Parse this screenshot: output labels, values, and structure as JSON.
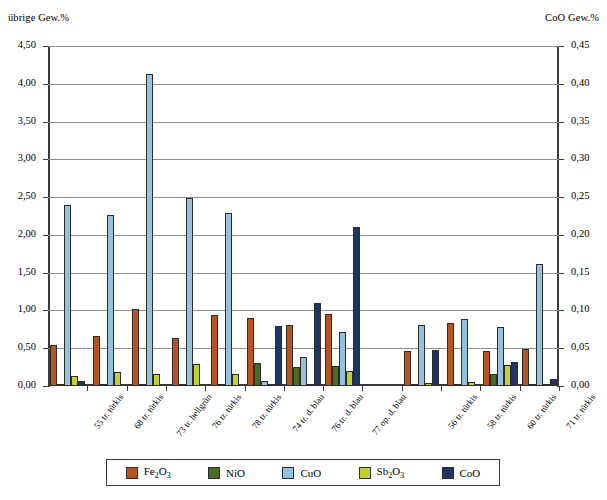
{
  "chart_data": {
    "type": "bar",
    "title": "",
    "subtitle": "",
    "xlabel": "",
    "ylabel": "übrige Gew.%",
    "ylabel_right": "CoO Gew.%",
    "ylim": [
      0,
      4.5
    ],
    "ylim_right": [
      0,
      0.45
    ],
    "ytick_step": 0.5,
    "ytick_step_right": 0.05,
    "grid": true,
    "legend_position": "bottom",
    "yticks_left": [
      "0,00",
      "0,50",
      "1,00",
      "1,50",
      "2,00",
      "2,50",
      "3,00",
      "3,50",
      "4,00",
      "4,50"
    ],
    "yticks_right": [
      "0,00",
      "0,05",
      "0,10",
      "0,15",
      "0,20",
      "0,25",
      "0,30",
      "0,35",
      "0,40",
      "0,45"
    ],
    "categories": [
      "55 tr. türkis",
      "68 tr. türkis",
      "73 tr. hellgrün",
      "76 tr. türkis",
      "78 tr. türkis",
      "74 tr. d. blau",
      "76 tr. d. blau",
      "77 op. d. blau",
      "",
      "56 tr. türkis",
      "58 tr. türkis",
      "60 tr. türkis",
      "71 tr. türkis"
    ],
    "series": [
      {
        "name": "Fe2O3",
        "label": "Fe₂O₃",
        "axis": "left",
        "color": "#b5541f",
        "values": [
          0.54,
          0.66,
          1.02,
          0.64,
          0.94,
          0.9,
          0.81,
          0.95,
          null,
          0.46,
          0.83,
          0.47,
          0.49
        ]
      },
      {
        "name": "NiO",
        "label": "NiO",
        "axis": "left",
        "color": "#4a6b23",
        "values": [
          0.02,
          0.02,
          0.03,
          0.02,
          0.03,
          0.3,
          0.25,
          0.26,
          null,
          0.02,
          0.02,
          0.16,
          0.02
        ]
      },
      {
        "name": "CuO",
        "label": "CuO",
        "axis": "left",
        "color": "#94c1dd",
        "values": [
          2.39,
          2.27,
          4.13,
          2.49,
          2.29,
          0.07,
          0.38,
          0.71,
          null,
          0.81,
          0.89,
          0.78,
          1.61
        ]
      },
      {
        "name": "Sb2O3",
        "label": "Sb₂O₃",
        "axis": "left",
        "color": "#c3cf35",
        "values": [
          0.13,
          0.18,
          0.16,
          0.29,
          0.16,
          0.02,
          0.02,
          0.2,
          null,
          0.04,
          0.05,
          0.28,
          0.02
        ]
      },
      {
        "name": "CoO",
        "label": "CoO",
        "axis": "right",
        "color": "#1f3566",
        "values": [
          0.007,
          0.0,
          0.0,
          0.0,
          0.0,
          0.08,
          0.11,
          0.21,
          null,
          0.048,
          0.0,
          0.032,
          0.009
        ]
      }
    ]
  },
  "legend": {
    "items": [
      {
        "label": "Fe₂O₃",
        "key": "fe"
      },
      {
        "label": "NiO",
        "key": "ni"
      },
      {
        "label": "CuO",
        "key": "cu"
      },
      {
        "label": "Sb₂O₃",
        "key": "sb"
      },
      {
        "label": "CoO",
        "key": "co"
      }
    ]
  }
}
